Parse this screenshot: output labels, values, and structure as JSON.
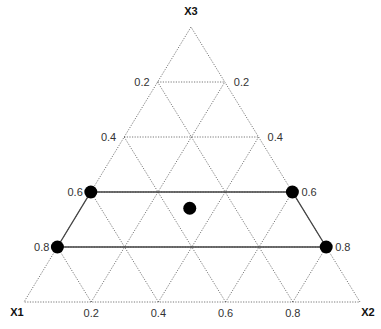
{
  "diagram": {
    "type": "ternary-simplex",
    "vertices": {
      "top": {
        "label": "X3",
        "x": 191,
        "y": 27
      },
      "bottom_left": {
        "label": "X1",
        "x": 24,
        "y": 302
      },
      "bottom_right": {
        "label": "X2",
        "x": 360,
        "y": 302
      }
    },
    "grid_divisions": 5,
    "left_edge_ticks": [
      "0.2",
      "0.4",
      "0.6",
      "0.8"
    ],
    "right_edge_ticks": [
      "0.8",
      "0.6",
      "0.4",
      "0.2"
    ],
    "bottom_edge_ticks": [
      "0.2",
      "0.4",
      "0.6",
      "0.8"
    ],
    "colors": {
      "grid": "#555555",
      "region": "#444444",
      "point": "#000000",
      "background": "#ffffff"
    }
  },
  "chart_data": {
    "type": "scatter",
    "title": "",
    "axes": [
      "X1",
      "X2",
      "X3"
    ],
    "axis_ticks": [
      0.2,
      0.4,
      0.6,
      0.8
    ],
    "points": [
      {
        "id": "left-upper",
        "X1": 0.6,
        "X2": 0.0,
        "X3": 0.4
      },
      {
        "id": "left-lower",
        "X1": 0.8,
        "X2": 0.0,
        "X3": 0.2
      },
      {
        "id": "right-upper",
        "X1": 0.0,
        "X2": 0.6,
        "X3": 0.4
      },
      {
        "id": "right-lower",
        "X1": 0.0,
        "X2": 0.8,
        "X3": 0.2
      },
      {
        "id": "centroid",
        "X1": 0.33,
        "X2": 0.33,
        "X3": 0.33
      }
    ],
    "region": {
      "shape": "trapezoid",
      "connects": [
        "left-upper",
        "right-upper",
        "right-lower",
        "left-lower"
      ],
      "X3_range": [
        0.2,
        0.4
      ]
    },
    "grid": true,
    "legend": null
  }
}
